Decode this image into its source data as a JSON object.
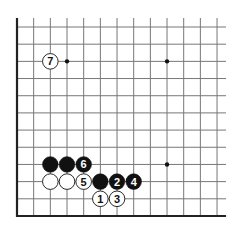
{
  "diagram": {
    "type": "go-board-corner",
    "colors": {
      "background": "#ffffff",
      "line": "#777777",
      "edge": "#222222",
      "black_stone": "#111111",
      "white_stone": "#ffffff",
      "star_point": "#111111"
    },
    "grid": {
      "columns": 13,
      "rows": 12,
      "origin_x": 17,
      "origin_y": 27,
      "spacing_x": 16.67,
      "spacing_y": 17.18,
      "open_right_extension": 9,
      "open_top_extension": 9,
      "edges": [
        "left",
        "bottom"
      ]
    },
    "star_points": [
      {
        "col": 3,
        "row": 2
      },
      {
        "col": 9,
        "row": 2
      },
      {
        "col": 9,
        "row": 8
      }
    ],
    "stones": [
      {
        "col": 2,
        "row": 8,
        "color": "black",
        "label": ""
      },
      {
        "col": 3,
        "row": 8,
        "color": "black",
        "label": ""
      },
      {
        "col": 4,
        "row": 8,
        "color": "black",
        "label": "6"
      },
      {
        "col": 2,
        "row": 9,
        "color": "white",
        "label": ""
      },
      {
        "col": 3,
        "row": 9,
        "color": "white",
        "label": ""
      },
      {
        "col": 4,
        "row": 9,
        "color": "white",
        "label": "5"
      },
      {
        "col": 5,
        "row": 9,
        "color": "black",
        "label": ""
      },
      {
        "col": 6,
        "row": 9,
        "color": "black",
        "label": "2"
      },
      {
        "col": 7,
        "row": 9,
        "color": "black",
        "label": "4"
      },
      {
        "col": 5,
        "row": 10,
        "color": "white",
        "label": "1"
      },
      {
        "col": 6,
        "row": 10,
        "color": "white",
        "label": "3"
      },
      {
        "col": 2,
        "row": 2,
        "color": "white",
        "label": "7"
      }
    ]
  }
}
